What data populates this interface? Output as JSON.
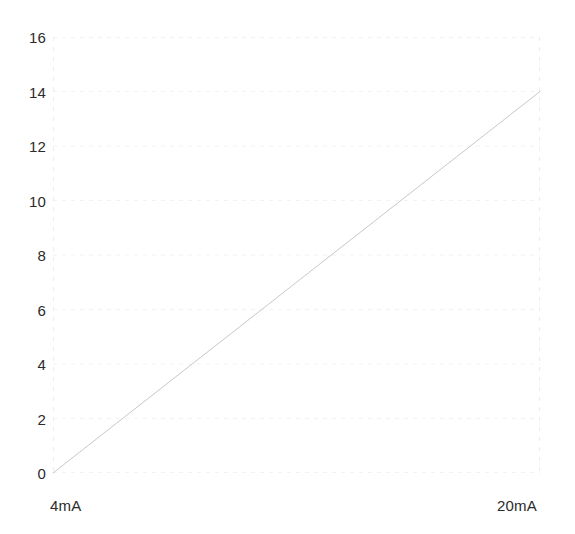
{
  "figure": {
    "background_color": "#ffffff",
    "top_text_remnant": "",
    "line_color": "#c8c8c8",
    "grid_color": "#f2f2f2",
    "axis_color": "#ededed",
    "tick_text_color": "#2b2b2b"
  },
  "chart_data": {
    "type": "line",
    "title": "",
    "subtitle": "",
    "xlabel": "",
    "ylabel": "",
    "grid": true,
    "legend": null,
    "legend_position": "none",
    "x": [
      4,
      20
    ],
    "x_unit": "mA",
    "xlim": [
      4,
      20
    ],
    "ylim": [
      0,
      16
    ],
    "x_tick_labels": [
      "4mA",
      "20mA"
    ],
    "x_tick_values": [
      4,
      20
    ],
    "y_tick_labels": [
      "16",
      "14",
      "12",
      "10",
      "8",
      "6",
      "4",
      "2",
      "0"
    ],
    "y_tick_values": [
      16,
      14,
      12,
      10,
      8,
      6,
      4,
      2,
      0
    ],
    "series": [
      {
        "name": "",
        "x": [
          4,
          20
        ],
        "values": [
          0,
          14
        ],
        "color": "#c8c8c8",
        "style": "solid",
        "width": 1
      }
    ],
    "annotations": []
  }
}
